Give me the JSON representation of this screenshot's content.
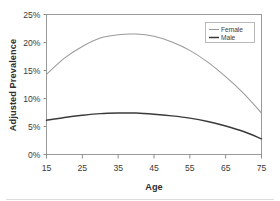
{
  "chart_data": {
    "type": "line",
    "title": "",
    "xlabel": "Age",
    "ylabel": "Adjusted Prevalence",
    "xlim": [
      15,
      75
    ],
    "ylim": [
      0,
      25
    ],
    "grid": false,
    "legend_position": "top-right",
    "x_tick_labels": [
      "15",
      "25",
      "35",
      "45",
      "55",
      "65",
      "75"
    ],
    "x_ticks": [
      15,
      25,
      35,
      45,
      55,
      65,
      75
    ],
    "y_tick_labels": [
      "0%",
      "5%",
      "10%",
      "15%",
      "20%",
      "25%"
    ],
    "y_ticks": [
      0,
      5,
      10,
      15,
      20,
      25
    ],
    "y_unit": "%",
    "x": [
      15,
      20,
      25,
      30,
      35,
      40,
      45,
      50,
      55,
      60,
      65,
      70,
      75
    ],
    "series": [
      {
        "name": "Female",
        "color": "#9a9a9a",
        "values": [
          14.3,
          17.2,
          19.3,
          20.8,
          21.4,
          21.5,
          21.1,
          20.1,
          18.6,
          16.5,
          13.9,
          10.9,
          7.4
        ]
      },
      {
        "name": "Male",
        "color": "#3a3a3a",
        "values": [
          6.1,
          6.6,
          7.0,
          7.3,
          7.4,
          7.4,
          7.2,
          6.9,
          6.5,
          5.9,
          5.1,
          4.1,
          2.8
        ]
      }
    ]
  },
  "legend": {
    "entries": [
      {
        "label": "Female"
      },
      {
        "label": "Male"
      }
    ]
  },
  "axes": {
    "y_title": "Adjusted Prevalence",
    "x_title": "Age"
  },
  "colors": {
    "female_series": "#9a9a9a",
    "male_series": "#3a3a3a",
    "frame": "#9a9a9a",
    "text": "#3a3a3a",
    "background": "#ffffff"
  }
}
